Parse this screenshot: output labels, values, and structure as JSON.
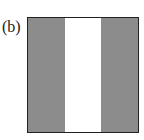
{
  "figure": {
    "label": "(b)",
    "stripes": [
      {
        "fill": "gray",
        "color": "#8c8c8c",
        "width_fraction": 0.333
      },
      {
        "fill": "white",
        "color": "#ffffff",
        "width_fraction": 0.334
      },
      {
        "fill": "gray",
        "color": "#8c8c8c",
        "width_fraction": 0.333
      }
    ],
    "border_color": "#222222"
  }
}
